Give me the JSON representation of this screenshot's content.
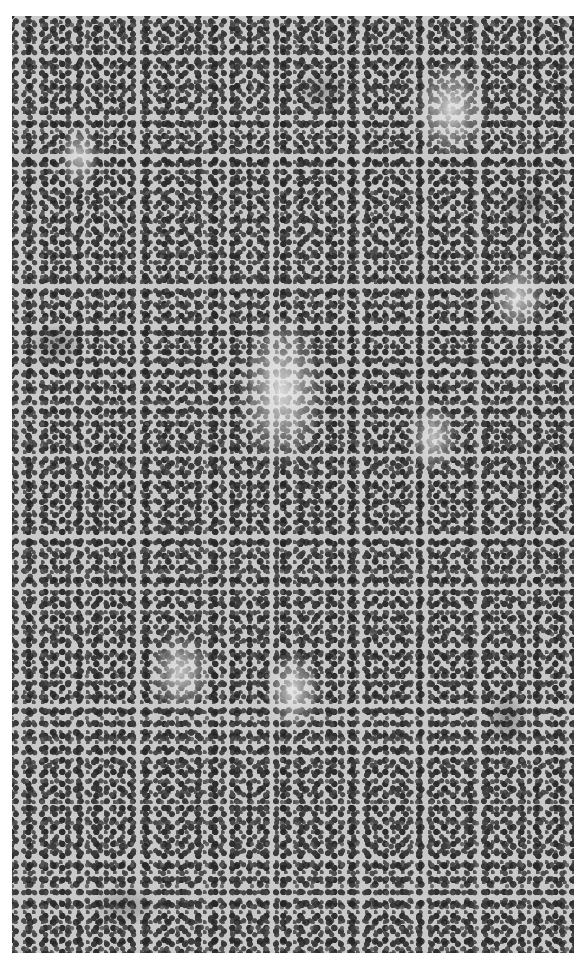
{
  "figure": {
    "type": "grayscale histology micrograph",
    "colors": {
      "page_background": "#ffffff",
      "tissue_base": "#c9c9c9",
      "nuclei_dark": "#2e2e2e",
      "stroma_pale": "#e8e8e8"
    }
  },
  "caption": {
    "text": ""
  }
}
